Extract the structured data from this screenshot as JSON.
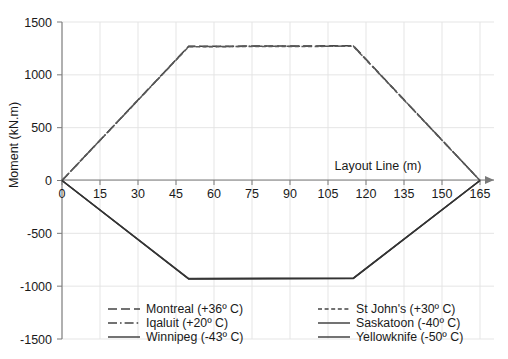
{
  "chart_data": {
    "type": "line",
    "title": "",
    "xlabel": "Layout Line (m)",
    "ylabel": "Moment (kN.m)",
    "xlim": [
      0,
      165
    ],
    "ylim": [
      -1500,
      1500
    ],
    "xticks": [
      0,
      15,
      30,
      45,
      60,
      75,
      90,
      105,
      120,
      135,
      150,
      165
    ],
    "yticks": [
      1500,
      1000,
      500,
      0,
      -500,
      -1000,
      -1500
    ],
    "xtick_labels": [
      "0",
      "15",
      "30",
      "45",
      "60",
      "75",
      "90",
      "105",
      "120",
      "135",
      "150",
      "165"
    ],
    "ytick_labels": [
      "1500",
      "1000",
      "500",
      "0",
      "-500",
      "-1000",
      "-1500"
    ],
    "grid": true,
    "legend_position": "bottom",
    "series": [
      {
        "name": "Montreal (+36º C)",
        "style": "dashed",
        "color": "#3f3f3f",
        "x": [
          0,
          50,
          115,
          165
        ],
        "y": [
          0,
          1270,
          1275,
          0
        ]
      },
      {
        "name": "Iqaluit (+20º C)",
        "style": "dashdot",
        "color": "#555555",
        "x": [
          0,
          50,
          115,
          165
        ],
        "y": [
          0,
          1268,
          1272,
          0
        ]
      },
      {
        "name": "Winnipeg (-43º C)",
        "style": "solid",
        "color": "#4a4a4a",
        "x": [
          0,
          50,
          115,
          165
        ],
        "y": [
          0,
          -930,
          -925,
          0
        ]
      },
      {
        "name": "St John's (+30º C)",
        "style": "fine-dashed",
        "color": "#5a5a5a",
        "x": [
          0,
          50,
          115,
          165
        ],
        "y": [
          0,
          1266,
          1270,
          0
        ]
      },
      {
        "name": "Saskatoon (-40º C)",
        "style": "solid",
        "color": "#4a4a4a",
        "x": [
          0,
          50,
          115,
          165
        ],
        "y": [
          0,
          -928,
          -923,
          0
        ]
      },
      {
        "name": "Yellowknife (-50º C)",
        "style": "solid",
        "color": "#333333",
        "x": [
          0,
          50,
          115,
          165
        ],
        "y": [
          0,
          -932,
          -927,
          0
        ]
      }
    ]
  },
  "legend": {
    "column_left": [
      {
        "label": "Montreal (+36º C)",
        "style": "dashed"
      },
      {
        "label": "Iqaluit (+20º C)",
        "style": "dashdot"
      },
      {
        "label": "Winnipeg (-43º C)",
        "style": "solid"
      }
    ],
    "column_right": [
      {
        "label": "St John's (+30º C)",
        "style": "fine-dashed"
      },
      {
        "label": "Saskatoon (-40º C)",
        "style": "solid"
      },
      {
        "label": "Yellowknife (-50º C)",
        "style": "solid"
      }
    ]
  },
  "axes": {
    "x_title": "Layout Line (m)",
    "y_title": "Moment (kN.m)"
  },
  "colors": {
    "axis": "#7a7a7a",
    "grid": "#e2e2e2",
    "text": "#1a1a1a",
    "series": "#444444",
    "background": "#ffffff"
  }
}
